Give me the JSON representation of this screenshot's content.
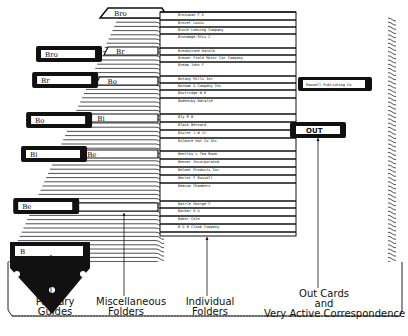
{
  "top_tab": {
    "label": "Bro"
  },
  "primary_guides": [
    {
      "label": "Bro",
      "y": 46
    },
    {
      "label": "Br",
      "y": 72
    },
    {
      "label": "Bo",
      "y": 112
    },
    {
      "label": "Bi",
      "y": 146
    },
    {
      "label": "Be",
      "y": 198
    },
    {
      "label": "B",
      "y": 242
    }
  ],
  "misc_folders": [
    {
      "label": "Br",
      "y": 47
    },
    {
      "label": "Bo",
      "y": 77
    },
    {
      "label": "Bi",
      "y": 114
    },
    {
      "label": "Be",
      "y": 150
    },
    {
      "label": "B",
      "y": 203
    }
  ],
  "individual_folders": [
    {
      "label": "Brossman  F E",
      "y": 16
    },
    {
      "label": "Brozel  Louis",
      "y": 24
    },
    {
      "label": "Bruce Leasing Company",
      "y": 31
    },
    {
      "label": "Brundage  Otis C",
      "y": 38
    },
    {
      "label": "Breakstone  Harold",
      "y": 52
    },
    {
      "label": "Brewer Field Motor Car Company",
      "y": 59
    },
    {
      "label": "Bream  John F",
      "y": 66
    },
    {
      "label": "Botany Mills Inc",
      "y": 80
    },
    {
      "label": "Borman & Company Inc",
      "y": 87
    },
    {
      "label": "Bostridge  W K",
      "y": 94
    },
    {
      "label": "Bodensky  Natalie",
      "y": 102
    },
    {
      "label": "Bly  R B",
      "y": 118
    },
    {
      "label": "Black  Bernard",
      "y": 126
    },
    {
      "label": "Bisler  J W Jr",
      "y": 134
    },
    {
      "label": "Bilmore Hat Co Inc",
      "y": 142
    },
    {
      "label": "Bentley's Tea Room",
      "y": 155
    },
    {
      "label": "Benner Incorporated",
      "y": 163
    },
    {
      "label": "Belmet Products Inc",
      "y": 171
    },
    {
      "label": "Bector  F Russell",
      "y": 179
    },
    {
      "label": "Beacon  Chambers",
      "y": 187
    },
    {
      "label": "Battle  George F",
      "y": 205
    },
    {
      "label": "Barber  D A",
      "y": 212
    },
    {
      "label": "Baker Cole",
      "y": 220
    },
    {
      "label": "B & B Cloak Company",
      "y": 228
    }
  ],
  "special_folder": {
    "label": "Maxwell Publishing Co"
  },
  "out_card": {
    "label": "OUT"
  },
  "captions": {
    "primary": [
      "Primary",
      "Guides"
    ],
    "misc": [
      "Miscellaneous",
      "Folders"
    ],
    "individual": [
      "Individual",
      "Folders"
    ],
    "out": [
      "Out Cards",
      "and",
      "Very Active Correspondence"
    ]
  }
}
